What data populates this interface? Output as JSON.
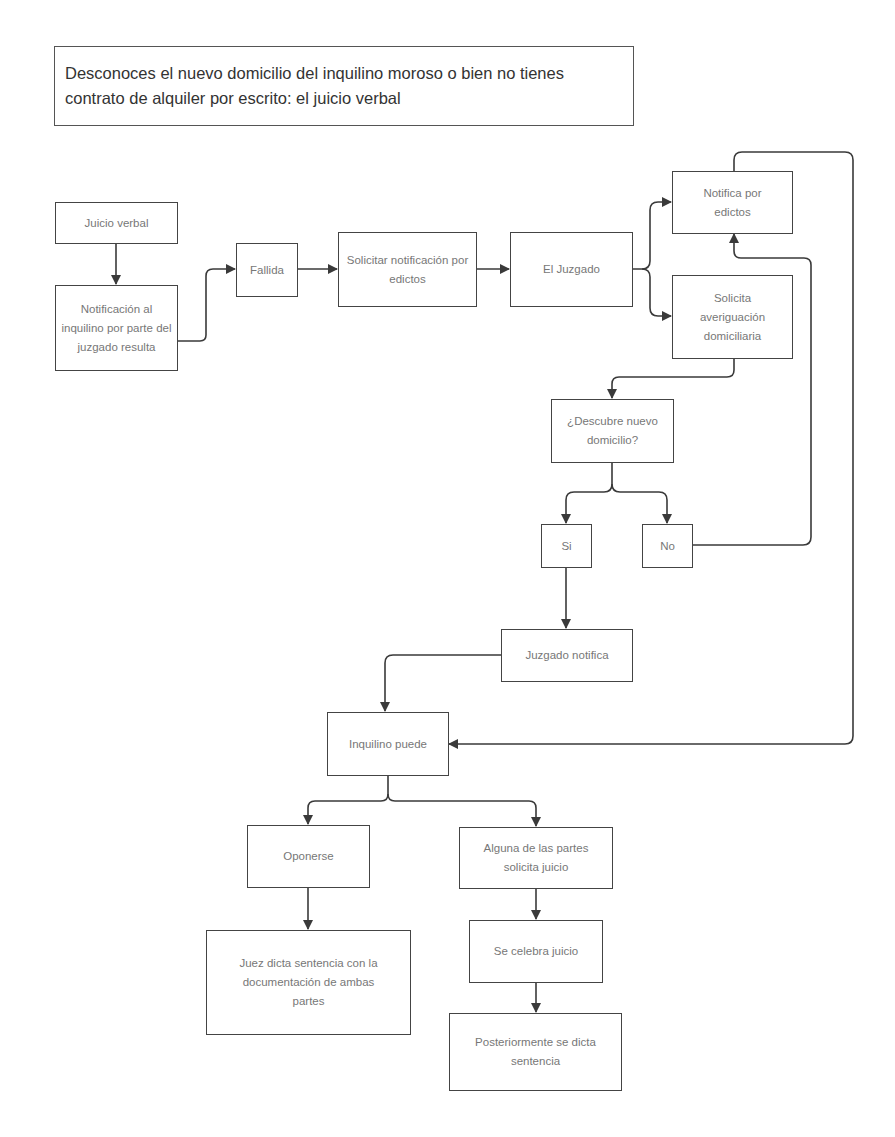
{
  "title": "Desconoces el nuevo domicilio del inquilino moroso o bien no tienes contrato de alquiler por escrito: el juicio verbal",
  "colors": {
    "line": "#3a3a3a",
    "border": "#444444",
    "node_text": "#777777",
    "title_text": "#333333",
    "background": "#ffffff"
  },
  "nodes": {
    "juicio_verbal": "Juicio verbal",
    "notificacion": "Notificación al inquilino por parte del juzgado resulta",
    "fallida": "Fallida",
    "solicitar_edictos": "Solicitar notificación por edictos",
    "el_juzgado": "El Juzgado",
    "notifica_edictos": "Notifica por edictos",
    "solicita_averiguacion": "Solicita averiguación domiciliaria",
    "descubre": "¿Descubre nuevo domicilio?",
    "si": "Si",
    "no": "No",
    "juzgado_notifica": "Juzgado notifica",
    "inquilino_puede": "Inquilino puede",
    "oponerse": "Oponerse",
    "alguna_partes": "Alguna de las partes solicita juicio",
    "juez_dicta": "Juez dicta sentencia con la documentación de ambas partes",
    "se_celebra": "Se celebra juicio",
    "posteriormente": "Posteriormente se dicta sentencia"
  },
  "edges": [
    [
      "juicio_verbal",
      "notificacion"
    ],
    [
      "notificacion",
      "fallida"
    ],
    [
      "fallida",
      "solicitar_edictos"
    ],
    [
      "solicitar_edictos",
      "el_juzgado"
    ],
    [
      "el_juzgado",
      "notifica_edictos"
    ],
    [
      "el_juzgado",
      "solicita_averiguacion"
    ],
    [
      "solicita_averiguacion",
      "descubre"
    ],
    [
      "descubre",
      "si"
    ],
    [
      "descubre",
      "no"
    ],
    [
      "no",
      "notifica_edictos"
    ],
    [
      "si",
      "juzgado_notifica"
    ],
    [
      "juzgado_notifica",
      "inquilino_puede"
    ],
    [
      "notifica_edictos",
      "inquilino_puede"
    ],
    [
      "inquilino_puede",
      "oponerse"
    ],
    [
      "inquilino_puede",
      "alguna_partes"
    ],
    [
      "oponerse",
      "juez_dicta"
    ],
    [
      "alguna_partes",
      "se_celebra"
    ],
    [
      "se_celebra",
      "posteriormente"
    ]
  ]
}
